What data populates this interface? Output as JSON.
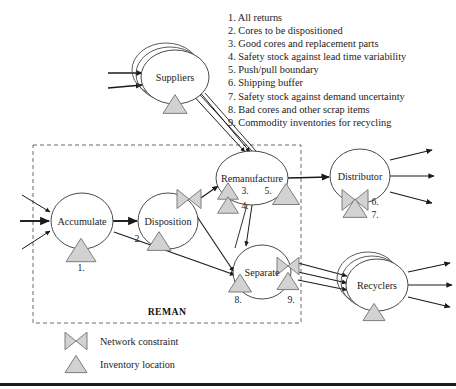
{
  "figure": {
    "boundary_label": "REMAN",
    "colors": {
      "marker_fill": "#d2d2d2",
      "marker_stroke": "#7d7d7d",
      "line": "#1a1a1a",
      "node_stroke": "#4a4a4a",
      "dashed_boundary": "#6b6b6b",
      "background": "#ffffff"
    }
  },
  "legend_list": [
    "1. All returns",
    "2. Cores to be dispositioned",
    "3. Good cores and replacement parts",
    "4. Safety stock against lead time variability",
    "5. Push/pull boundary",
    "6. Shipping buffer",
    "7. Safety stock against demand uncertainty",
    "8. Bad cores and other scrap items",
    "9. Commodity inventories for recycling"
  ],
  "nodes": [
    {
      "id": "suppliers",
      "label": "Suppliers",
      "x": 175,
      "y": 77,
      "rx": 34,
      "ry": 27,
      "stacked": true
    },
    {
      "id": "accumulate",
      "label": "Accumulate",
      "x": 82,
      "y": 221,
      "rx": 31,
      "ry": 28,
      "stacked": false
    },
    {
      "id": "disposition",
      "label": "Disposition",
      "x": 168,
      "y": 221,
      "rx": 30,
      "ry": 28,
      "stacked": false
    },
    {
      "id": "remanufacture",
      "label": "Remanufacture",
      "x": 252,
      "y": 178,
      "rx": 36,
      "ry": 27,
      "stacked": false
    },
    {
      "id": "distributor",
      "label": "Distributor",
      "x": 360,
      "y": 176,
      "rx": 30,
      "ry": 27,
      "stacked": false
    },
    {
      "id": "separate",
      "label": "Separate",
      "x": 262,
      "y": 272,
      "rx": 29,
      "ry": 27,
      "stacked": false
    },
    {
      "id": "recyclers",
      "label": "Recyclers",
      "x": 377,
      "y": 285,
      "rx": 31,
      "ry": 26,
      "stacked": true
    }
  ],
  "markers": [
    {
      "id": "m1",
      "type": "triangle",
      "x": 81,
      "y": 250,
      "w": 30,
      "num": "1.",
      "nx": 81,
      "ny": 267
    },
    {
      "id": "m2",
      "type": "triangle",
      "x": 159,
      "y": 241,
      "w": 24,
      "num": "2.",
      "nx": 138,
      "ny": 238
    },
    {
      "id": "m3",
      "type": "triangle",
      "x": 228,
      "y": 191,
      "w": 21,
      "num": "3.",
      "nx": 245,
      "ny": 190
    },
    {
      "id": "m4",
      "type": "triangle",
      "x": 228,
      "y": 205,
      "w": 21,
      "num": "4.",
      "nx": 245,
      "ny": 205
    },
    {
      "id": "m5",
      "type": "triangle",
      "x": 286,
      "y": 194,
      "w": 27,
      "num": "5.",
      "nx": 268,
      "ny": 190
    },
    {
      "id": "m6",
      "type": "bowtie",
      "x": 355,
      "y": 200,
      "w": 26,
      "num": "6.",
      "nx": 375,
      "ny": 201
    },
    {
      "id": "m7",
      "type": "triangle",
      "x": 355,
      "y": 208,
      "w": 24,
      "num": "7.",
      "nx": 375,
      "ny": 214
    },
    {
      "id": "m8",
      "type": "triangle",
      "x": 240,
      "y": 283,
      "w": 23,
      "num": "8.",
      "nx": 238,
      "ny": 299
    },
    {
      "id": "m9a",
      "type": "bowtie",
      "x": 288,
      "y": 266,
      "w": 22,
      "num": "",
      "nx": 0,
      "ny": 0
    },
    {
      "id": "m9b",
      "type": "triangle",
      "x": 288,
      "y": 281,
      "w": 22,
      "num": "9.",
      "nx": 291,
      "ny": 299
    },
    {
      "id": "m-suppliers",
      "type": "triangle",
      "x": 175,
      "y": 104,
      "w": 24,
      "num": "",
      "nx": 0,
      "ny": 0
    },
    {
      "id": "m-recyclers",
      "type": "triangle",
      "x": 374,
      "y": 312,
      "w": 22,
      "num": "",
      "nx": 0,
      "ny": 0
    },
    {
      "id": "m-disposition-bowtie",
      "type": "bowtie",
      "x": 189,
      "y": 199,
      "w": 24,
      "num": "",
      "nx": 0,
      "ny": 0
    }
  ],
  "boundary": {
    "x": 33,
    "y": 145,
    "width": 268,
    "height": 178,
    "label_x": 167,
    "label_y": 311
  },
  "key": [
    {
      "id": "network-constraint",
      "shape": "bowtie",
      "label": "Network constraint",
      "x": 76,
      "y": 341
    },
    {
      "id": "inventory-location",
      "shape": "triangle",
      "label": "Inventory location",
      "x": 76,
      "y": 364
    }
  ],
  "rule": {
    "y": 383
  }
}
